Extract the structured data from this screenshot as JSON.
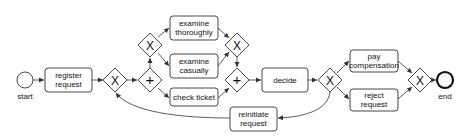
{
  "diagram": {
    "type": "BPMN process model",
    "events": {
      "start": {
        "label": "start"
      },
      "end": {
        "label": "end"
      }
    },
    "tasks": {
      "register_request": {
        "line1": "register",
        "line2": "request"
      },
      "examine_thoroughly": {
        "line1": "examine",
        "line2": "thoroughly"
      },
      "examine_casually": {
        "line1": "examine",
        "line2": "casually"
      },
      "check_ticket": {
        "line1": "check ticket"
      },
      "decide": {
        "line1": "decide"
      },
      "pay_compensation": {
        "line1": "pay",
        "line2": "compensation"
      },
      "reject_request": {
        "line1": "reject",
        "line2": "request"
      },
      "reinitiate_request": {
        "line1": "reinitiate",
        "line2": "request"
      }
    },
    "gateways": {
      "xor_symbol": "X",
      "and_symbol": "+"
    }
  }
}
